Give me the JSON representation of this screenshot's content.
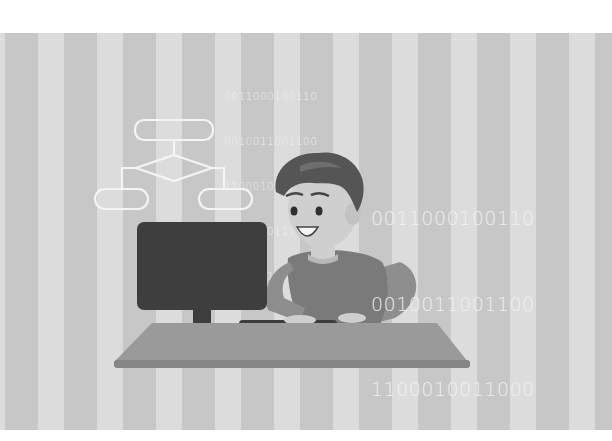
{
  "illustration": {
    "subject": "boy-programming-at-computer",
    "palette": {
      "page_bg": "#ffffff",
      "stripe_dark": "#c7c7c7",
      "stripe_light": "#dcdcdc",
      "binary_text": "#f2f2f2",
      "monitor": "#3e3e3e",
      "desk_top": "#9a9a9a",
      "desk_edge": "#858585",
      "shirt": "#7a7a7a",
      "arm": "#8e8e8e",
      "hair": "#555555",
      "skin": "#cfcfcf",
      "flowchart_stroke": "#f4f4f4"
    }
  },
  "binary_small": {
    "lines": [
      "0011000100110",
      "0010011001100",
      "1100010011000",
      "1001100110011",
      "0001001100010"
    ]
  },
  "binary_large": {
    "lines": [
      "0011000100110",
      "0010011001100",
      "1100010011000",
      "1001100110011",
      "001001100010"
    ]
  },
  "flowchart": {
    "shapes": [
      "top-rounded-rect",
      "decision-diamond",
      "left-rounded-rect",
      "right-rounded-rect"
    ]
  }
}
